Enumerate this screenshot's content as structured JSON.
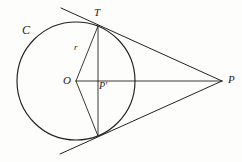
{
  "figure": {
    "background_color": "#fdfdfb",
    "ink_color": "#24221f",
    "labels": {
      "circle": "C",
      "tangent_point_upper": "T",
      "radius": "r",
      "center": "O",
      "foot_of_chord": "P'",
      "external_point": "P"
    },
    "geometry": {
      "circle": {
        "cx": 76,
        "cy": 81,
        "r": 59
      },
      "points": {
        "O": [
          76,
          81
        ],
        "T": [
          98,
          26
        ],
        "T_lower": [
          98,
          136
        ],
        "P_prime": [
          98,
          81
        ],
        "P": [
          222,
          81
        ]
      },
      "segments": [
        {
          "name": "radius-O-to-T",
          "from": [
            76,
            81
          ],
          "to": [
            98,
            26
          ]
        },
        {
          "name": "radius-O-to-T-lower",
          "from": [
            76,
            81
          ],
          "to": [
            98,
            136
          ]
        },
        {
          "name": "axis-O-to-P",
          "from": [
            76,
            81
          ],
          "to": [
            222,
            81
          ]
        },
        {
          "name": "chord-T-to-T-lower",
          "from": [
            98,
            26
          ],
          "to": [
            98,
            136
          ]
        },
        {
          "name": "tangent-upper",
          "from": [
            61,
            8
          ],
          "to": [
            222,
            81
          ]
        },
        {
          "name": "tangent-lower",
          "from": [
            60,
            154
          ],
          "to": [
            222,
            81
          ]
        }
      ]
    }
  }
}
